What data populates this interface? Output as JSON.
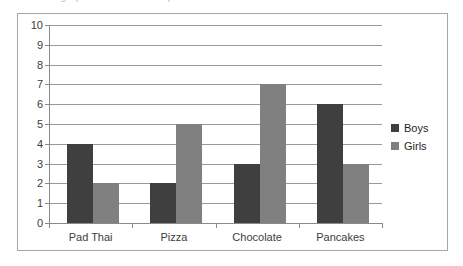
{
  "caption": {
    "text": "Look at the graph and answer the questions below:"
  },
  "chart_data": {
    "type": "bar",
    "title": "",
    "subtitle": "",
    "xlabel": "",
    "ylabel": "",
    "categories": [
      "Pad Thai",
      "Pizza",
      "Chocolate",
      "Pancakes"
    ],
    "series": [
      {
        "name": "Boys",
        "color": "#3f3f3f",
        "values": [
          4,
          2,
          3,
          6
        ]
      },
      {
        "name": "Girls",
        "color": "#808080",
        "values": [
          2,
          5,
          7,
          3
        ]
      }
    ],
    "ylim": [
      0,
      10
    ],
    "ytick_step": 1,
    "ytick_labels": [
      "10",
      "9",
      "8",
      "7",
      "6",
      "5",
      "4",
      "3",
      "2",
      "1",
      "0"
    ],
    "grid": true,
    "grid_axis": "y",
    "legend_position": "right",
    "border": true,
    "border_color": "#a6a6a6",
    "plot_background": "#ffffff"
  },
  "legend": {
    "items": [
      {
        "label": "Boys",
        "color": "#3f3f3f"
      },
      {
        "label": "Girls",
        "color": "#808080"
      }
    ]
  },
  "colors": {
    "boys": "#3f3f3f",
    "girls": "#808080",
    "grid": "#9a9a9a",
    "axis": "#8a8a8a",
    "frame": "#a6a6a6",
    "text": "#3d3d3d"
  }
}
